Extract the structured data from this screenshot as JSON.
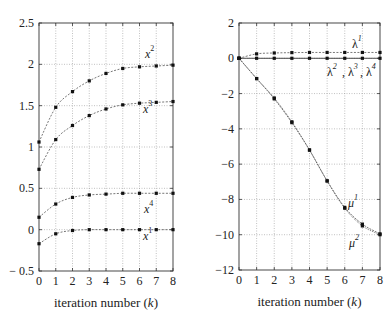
{
  "chart_data": [
    {
      "type": "line",
      "title": "",
      "xlabel": "iteration number (k)",
      "ylabel": "",
      "x": [
        0,
        1,
        2,
        3,
        4,
        5,
        6,
        7,
        8
      ],
      "xlim": [
        0,
        8
      ],
      "ylim": [
        -0.5,
        2.5
      ],
      "yticks": [
        -0.5,
        0,
        0.5,
        1,
        1.5,
        2,
        2.5
      ],
      "ytick_labels": [
        "− 0.5",
        "0",
        "0.5",
        "1",
        "1.5",
        "2",
        "2.5"
      ],
      "xticks": [
        0,
        1,
        2,
        3,
        4,
        5,
        6,
        7,
        8
      ],
      "grid": true,
      "series": [
        {
          "name": "x1",
          "label_base": "x",
          "label_sup": "1",
          "values": [
            -0.17,
            -0.05,
            -0.01,
            0,
            0,
            0,
            0,
            0,
            0
          ]
        },
        {
          "name": "x2",
          "label_base": "x",
          "label_sup": "2",
          "values": [
            1.06,
            1.48,
            1.67,
            1.8,
            1.89,
            1.95,
            1.97,
            1.98,
            1.99
          ]
        },
        {
          "name": "x3",
          "label_base": "x",
          "label_sup": "3",
          "values": [
            0.73,
            1.09,
            1.26,
            1.38,
            1.46,
            1.51,
            1.53,
            1.54,
            1.55
          ]
        },
        {
          "name": "x4",
          "label_base": "x",
          "label_sup": "4",
          "values": [
            0.15,
            0.31,
            0.39,
            0.42,
            0.43,
            0.44,
            0.44,
            0.44,
            0.44
          ]
        }
      ]
    },
    {
      "type": "line",
      "title": "",
      "xlabel": "iteration number (k)",
      "ylabel": "",
      "x": [
        0,
        1,
        2,
        3,
        4,
        5,
        6,
        7,
        8
      ],
      "xlim": [
        0,
        8
      ],
      "ylim": [
        -12,
        2
      ],
      "yticks": [
        -12,
        -10,
        -8,
        -6,
        -4,
        -2,
        0,
        2
      ],
      "ytick_labels": [
        "−12",
        "−10",
        "−8",
        "−6",
        "−4",
        "−2",
        "0",
        "2"
      ],
      "xticks": [
        0,
        1,
        2,
        3,
        4,
        5,
        6,
        7,
        8
      ],
      "grid": true,
      "series": [
        {
          "name": "lambda1",
          "label": "λ¹",
          "values": [
            0,
            0.25,
            0.3,
            0.32,
            0.33,
            0.33,
            0.33,
            0.33,
            0.33
          ]
        },
        {
          "name": "lambda2,3,4",
          "label": "λ², λ³, λ⁴",
          "values": [
            0,
            0,
            0,
            0,
            0,
            0,
            0,
            0,
            0
          ]
        },
        {
          "name": "mu1",
          "label": "μ¹",
          "values": [
            0,
            -1.15,
            -2.3,
            -3.65,
            -5.2,
            -6.95,
            -8.45,
            -9.4,
            -9.95
          ]
        },
        {
          "name": "mu2",
          "label": "μ²",
          "values": [
            0,
            -1.15,
            -2.25,
            -3.6,
            -5.2,
            -6.95,
            -8.5,
            -9.5,
            -10.0
          ]
        }
      ]
    }
  ]
}
